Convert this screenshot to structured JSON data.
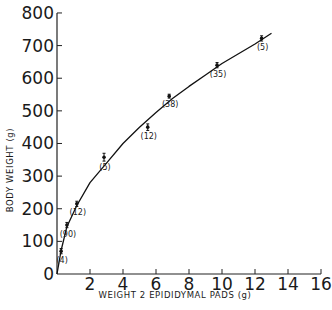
{
  "chart_data": {
    "type": "line",
    "title": "",
    "xlabel": "WEIGHT 2 EPIDIDYMAL PADS (g)",
    "ylabel": "BODY WEIGHT (g)",
    "xlim": [
      0,
      16
    ],
    "ylim": [
      0,
      800
    ],
    "x_ticks": [
      2,
      4,
      6,
      8,
      10,
      12,
      14,
      16
    ],
    "x_tick_labels": [
      "2",
      "4",
      "6",
      "8",
      "10",
      "12",
      "14",
      "16"
    ],
    "y_ticks": [
      0,
      100,
      200,
      300,
      400,
      500,
      600,
      700,
      800
    ],
    "y_tick_labels": [
      "0",
      "100",
      "200",
      "300",
      "400",
      "500",
      "600",
      "700",
      "800"
    ],
    "grid": false,
    "points": [
      {
        "x": 0.25,
        "y": 70,
        "err": 8,
        "n_label": "(4)"
      },
      {
        "x": 0.6,
        "y": 150,
        "err": 8,
        "n_label": "(90)"
      },
      {
        "x": 1.2,
        "y": 215,
        "err": 8,
        "n_label": "(12)"
      },
      {
        "x": 2.85,
        "y": 358,
        "err": 12,
        "n_label": "(5)"
      },
      {
        "x": 5.5,
        "y": 450,
        "err": 10,
        "n_label": "(12)"
      },
      {
        "x": 6.8,
        "y": 545,
        "err": 6,
        "n_label": "(38)"
      },
      {
        "x": 9.7,
        "y": 640,
        "err": 8,
        "n_label": "(35)"
      },
      {
        "x": 12.4,
        "y": 722,
        "err": 8,
        "n_label": "(5)"
      }
    ],
    "fitted_curve": {
      "x": [
        0,
        0.25,
        0.6,
        1.2,
        2,
        3,
        4,
        5,
        6,
        7,
        8,
        9,
        10,
        11,
        12,
        13
      ],
      "y": [
        0,
        72,
        145,
        210,
        280,
        340,
        400,
        450,
        495,
        538,
        575,
        610,
        645,
        675,
        705,
        738
      ]
    }
  }
}
